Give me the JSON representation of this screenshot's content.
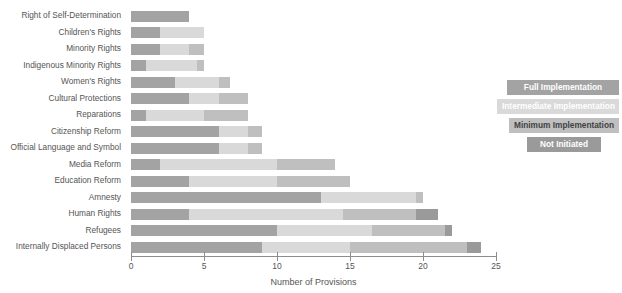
{
  "chart_data": {
    "type": "bar",
    "orientation": "horizontal",
    "stacked": true,
    "title": "",
    "xlabel": "Number of Provisions",
    "ylabel": "",
    "xlim": [
      0,
      25
    ],
    "xticks": [
      0,
      5,
      10,
      15,
      20,
      25
    ],
    "grid": false,
    "legend_position": "right",
    "categories": [
      "Right of Self-Determination",
      "Children's Rights",
      "Minority Rights",
      "Indigenous Minority Rights",
      "Women's Rights",
      "Cultural Protections",
      "Reparations",
      "Citizenship Reform",
      "Official Language and Symbol",
      "Media Reform",
      "Education Reform",
      "Amnesty",
      "Human Rights",
      "Refugees",
      "Internally Displaced Persons"
    ],
    "series": [
      {
        "name": "Full Implementation",
        "color": "#a3a3a3",
        "values": [
          4,
          2,
          2,
          1,
          3,
          4,
          1,
          6,
          6,
          2,
          4,
          13,
          4,
          10,
          9
        ]
      },
      {
        "name": "Intermediate Implementation",
        "color": "#d9d9d9",
        "values": [
          0,
          3,
          2,
          3.5,
          3,
          2,
          4,
          2,
          2,
          8,
          6,
          6.5,
          10.5,
          6.5,
          6
        ]
      },
      {
        "name": "Minimum Implementation",
        "color": "#bfbfbf",
        "values": [
          0,
          0,
          1,
          0.5,
          0.8,
          2,
          3,
          1,
          1,
          4,
          5,
          0.5,
          5,
          5,
          8
        ]
      },
      {
        "name": "Not Initiated",
        "color": "#9a9a9a",
        "values": [
          0,
          0,
          0,
          0,
          0,
          0,
          0,
          0,
          0,
          0,
          0,
          0,
          1.5,
          0.5,
          1
        ]
      }
    ],
    "totals": [
      4,
      5,
      5,
      5,
      6.8,
      8,
      8,
      9,
      9,
      14,
      15,
      20,
      21,
      22,
      24
    ]
  },
  "legend": {
    "items": [
      {
        "label": "Full Implementation",
        "color": "#a3a3a3"
      },
      {
        "label": "Intermediate Implementation",
        "color": "#d9d9d9"
      },
      {
        "label": "Minimum Implementation",
        "color": "#bfbfbf"
      },
      {
        "label": "Not Initiated",
        "color": "#9a9a9a"
      }
    ]
  },
  "axis": {
    "tick_labels": [
      "0",
      "5",
      "10",
      "15",
      "20",
      "25"
    ],
    "title": "Number of Provisions"
  }
}
